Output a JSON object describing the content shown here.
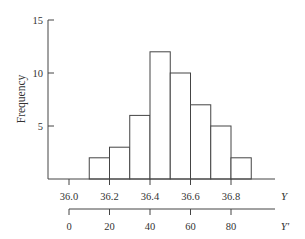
{
  "chart_data": {
    "type": "bar",
    "subtype": "histogram",
    "title": "",
    "ylabel": "Frequency",
    "xlabel": "Y",
    "secondary_xlabel": "Y'",
    "bin_edges": [
      36.1,
      36.2,
      36.3,
      36.4,
      36.5,
      36.6,
      36.7,
      36.8,
      36.9
    ],
    "categories": [
      "36.1-36.2",
      "36.2-36.3",
      "36.3-36.4",
      "36.4-36.5",
      "36.5-36.6",
      "36.6-36.7",
      "36.7-36.8",
      "36.8-36.9"
    ],
    "values": [
      2,
      3,
      6,
      12,
      10,
      7,
      5,
      2
    ],
    "ylim": [
      0,
      15
    ],
    "yticks": [
      "5",
      "10",
      "15"
    ],
    "xticks": [
      "36.0",
      "36.2",
      "36.4",
      "36.6",
      "36.8"
    ],
    "secondary_xticks": [
      "0",
      "20",
      "40",
      "60",
      "80"
    ],
    "grid": false,
    "legend": null
  }
}
